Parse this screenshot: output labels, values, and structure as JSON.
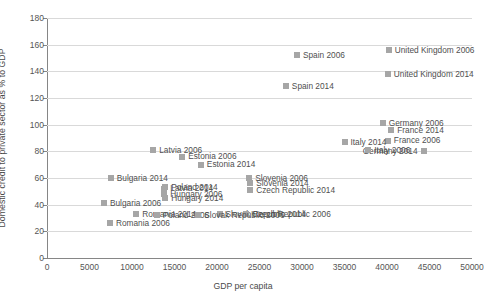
{
  "chart_data": {
    "type": "scatter",
    "title": "",
    "xlabel": "GDP per capita",
    "ylabel": "Domestic credit to private sector as % to GDP",
    "xlim": [
      0,
      50000
    ],
    "ylim": [
      0,
      180
    ],
    "xticks": [
      "0",
      "5000",
      "10000",
      "15000",
      "20000",
      "25000",
      "30000",
      "35000",
      "40000",
      "45000",
      "50000"
    ],
    "yticks": [
      "0",
      "20",
      "40",
      "60",
      "80",
      "100",
      "120",
      "140",
      "160",
      "180"
    ],
    "grid": "horizontal",
    "legend": "none",
    "marker_color": "#a6a6a6",
    "points": [
      {
        "label": "United Kingdom 2006",
        "x": 40200,
        "y": 156
      },
      {
        "label": "Spain 2006",
        "x": 29400,
        "y": 152
      },
      {
        "label": "United Kingdom 2014",
        "x": 40100,
        "y": 138
      },
      {
        "label": "Spain 2014",
        "x": 28100,
        "y": 129
      },
      {
        "label": "Germany 2006",
        "x": 39500,
        "y": 101
      },
      {
        "label": "France 2014",
        "x": 40500,
        "y": 96
      },
      {
        "label": "France 2006",
        "x": 40100,
        "y": 88
      },
      {
        "label": "Germany 2014",
        "x": 44300,
        "y": 80
      },
      {
        "label": "Italy 2014",
        "x": 35000,
        "y": 87
      },
      {
        "label": "Italy 2006",
        "x": 37800,
        "y": 81
      },
      {
        "label": "Latvia 2006",
        "x": 12500,
        "y": 81
      },
      {
        "label": "Estonia 2006",
        "x": 15900,
        "y": 76
      },
      {
        "label": "Estonia 2014",
        "x": 18100,
        "y": 70
      },
      {
        "label": "Slovenia 2006",
        "x": 23800,
        "y": 60
      },
      {
        "label": "Slovenia 2014",
        "x": 23900,
        "y": 56
      },
      {
        "label": "Bulgaria 2014",
        "x": 7500,
        "y": 60
      },
      {
        "label": "Poland 2014",
        "x": 13900,
        "y": 53
      },
      {
        "label": "Latvia 2014",
        "x": 13800,
        "y": 52
      },
      {
        "label": "Czech Republic 2014",
        "x": 23900,
        "y": 51
      },
      {
        "label": "Hungary 2006",
        "x": 13800,
        "y": 48
      },
      {
        "label": "Hungary 2014",
        "x": 13900,
        "y": 45
      },
      {
        "label": "Bulgaria 2006",
        "x": 6700,
        "y": 41
      },
      {
        "label": "Slovak Republic 2014",
        "x": 20300,
        "y": 33
      },
      {
        "label": "Czech Republic 2006",
        "x": 23400,
        "y": 33
      },
      {
        "label": "Romania 2014",
        "x": 10500,
        "y": 33
      },
      {
        "label": "Poland 2006",
        "x": 12900,
        "y": 32
      },
      {
        "label": "Slovak Republic 2006",
        "x": 17800,
        "y": 32
      },
      {
        "label": "Romania 2006",
        "x": 7400,
        "y": 26
      }
    ]
  }
}
